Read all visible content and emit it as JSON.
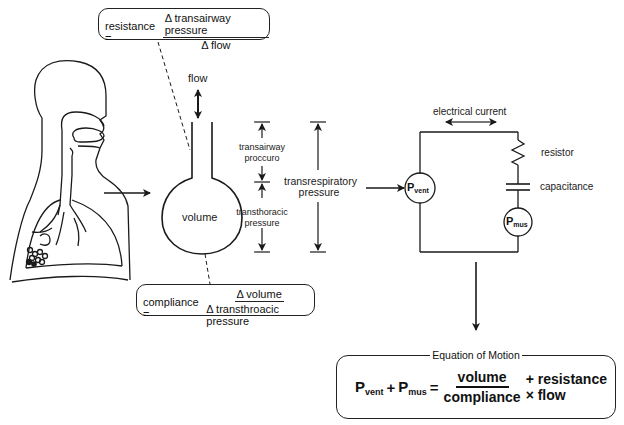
{
  "resistance_box": {
    "lhs": "resistance =",
    "numerator": "Δ transairway pressure",
    "denominator": "Δ flow"
  },
  "compliance_box": {
    "lhs": "compliance =",
    "numerator": "Δ volume",
    "denominator": "Δ transthroacic pressure"
  },
  "lung_model": {
    "flow_label": "flow",
    "volume_label": "volume",
    "transairway_label_1": "transairway",
    "transairway_label_2": "proccuro",
    "transthoracic_label_1": "transthoracic",
    "transthoracic_label_2": "pressure",
    "transrespiratory_label_1": "transrespiratory",
    "transrespiratory_label_2": "pressure"
  },
  "circuit": {
    "current_label": "electrical current",
    "resistor_label": "resistor",
    "capacitance_label": "capacitance",
    "pvent_main": "P",
    "pvent_sub": "vent",
    "pmus_main": "P",
    "pmus_sub": "mus"
  },
  "equation_of_motion": {
    "title": "Equation of Motion",
    "p1": "P",
    "p1_sub": "vent",
    "plus1": "+",
    "p2": "P",
    "p2_sub": "mus",
    "equals": "=",
    "numerator": "volume",
    "denominator": "compliance",
    "rest": "+ resistance × flow"
  },
  "colors": {
    "line": "#1a1a1a",
    "background": "#ffffff"
  }
}
